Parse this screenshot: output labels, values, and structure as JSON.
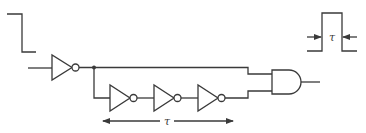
{
  "diagram": {
    "colors": {
      "line": "#3a3a3a",
      "background": "#ffffff"
    },
    "input_waveform": {
      "type": "falling-edge"
    },
    "output_waveform": {
      "type": "positive-pulse",
      "width_label": "τ"
    },
    "components": [
      {
        "id": "inv1",
        "type": "inverter"
      },
      {
        "id": "inv2",
        "type": "inverter"
      },
      {
        "id": "inv3",
        "type": "inverter"
      },
      {
        "id": "inv4",
        "type": "inverter"
      },
      {
        "id": "and1",
        "type": "and-gate"
      }
    ],
    "delay_chain_label": "τ",
    "pulse_width_label": "τ"
  }
}
